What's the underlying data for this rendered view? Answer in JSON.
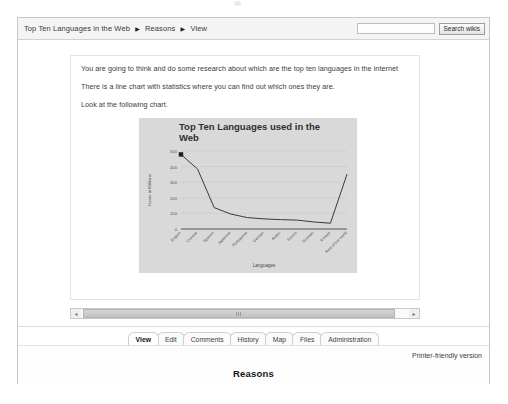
{
  "topbar": {
    "breadcrumb": [
      "Top Ten Languages in the Web",
      "Reasons",
      "View"
    ],
    "separator": "▶",
    "search_value": "",
    "search_placeholder": "",
    "search_button_label": "Search wikis"
  },
  "article": {
    "paragraphs": [
      "You are going to think and do some research about which are the top ten languages in the internet",
      "There is a line chart with statistics where you can find out which ones they are.",
      "Look at the following chart."
    ]
  },
  "chart_data": {
    "type": "line",
    "xlabel": "Languages",
    "ylabel": "Users in Millions",
    "grid": true,
    "legend": "none",
    "marker_first_point": true,
    "ylim": [
      0,
      500
    ],
    "yticks": [
      0,
      100,
      200,
      300,
      400,
      500
    ],
    "ytick_labels": [
      "0",
      "100",
      "200",
      "300",
      "400",
      "500"
    ],
    "categories": [
      "English",
      "Chinese",
      "Spanish",
      "Japanese",
      "Portuguese",
      "German",
      "Arabic",
      "French",
      "Russian",
      "Korean",
      "Rest of the world"
    ],
    "series": [
      {
        "name": "Users in Millions",
        "values": [
          478,
          384,
          137,
          96,
          73,
          65,
          60,
          57,
          45,
          37,
          351
        ]
      }
    ]
  },
  "scrollbar": {
    "left_arrow": "◄",
    "right_arrow": "►",
    "orientation": "horizontal"
  },
  "tabs": [
    {
      "label": "View",
      "active": true
    },
    {
      "label": "Edit",
      "active": false
    },
    {
      "label": "Comments",
      "active": false
    },
    {
      "label": "History",
      "active": false
    },
    {
      "label": "Map",
      "active": false
    },
    {
      "label": "Files",
      "active": false
    },
    {
      "label": "Administration",
      "active": false
    }
  ],
  "footer": {
    "printer_link": "Printer-friendly version",
    "page_heading": "Reasons"
  },
  "colors": {
    "chart_background": "#d9d9d9",
    "chart_line": "#3a3a3a",
    "page_border": "#c8c8c8",
    "topbar_background": "#f4f4f4"
  }
}
